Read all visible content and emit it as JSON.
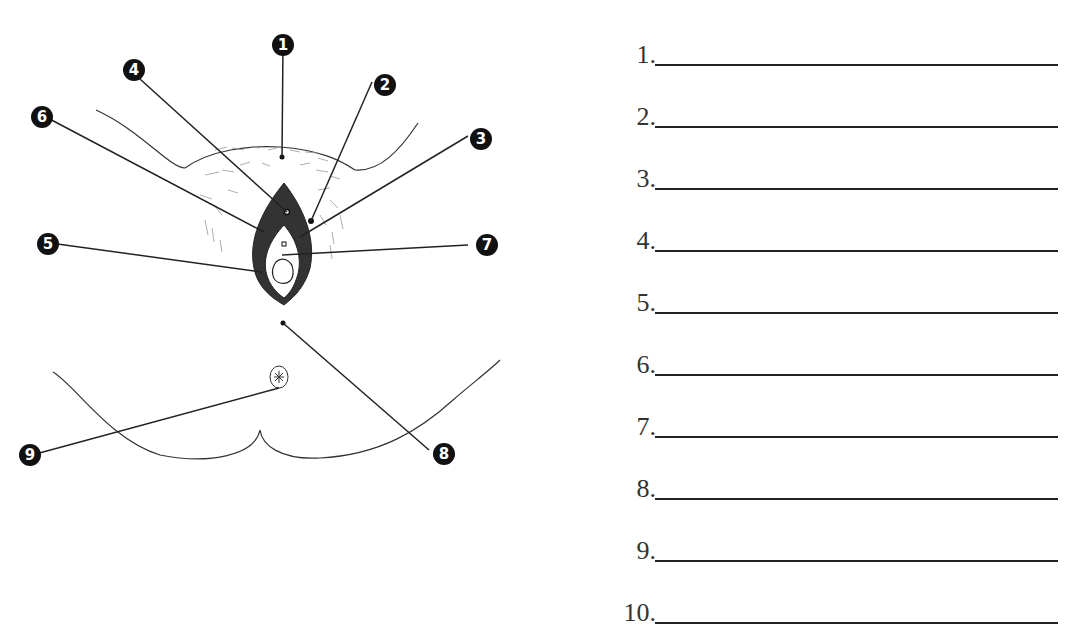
{
  "diagram": {
    "callouts": [
      {
        "label": "1",
        "x": 272,
        "y": 34
      },
      {
        "label": "2",
        "x": 374,
        "y": 74
      },
      {
        "label": "3",
        "x": 470,
        "y": 128
      },
      {
        "label": "4",
        "x": 123,
        "y": 59
      },
      {
        "label": "5",
        "x": 37,
        "y": 233
      },
      {
        "label": "6",
        "x": 31,
        "y": 106
      },
      {
        "label": "7",
        "x": 476,
        "y": 234
      },
      {
        "label": "8",
        "x": 433,
        "y": 443
      },
      {
        "label": "9",
        "x": 19,
        "y": 444
      }
    ]
  },
  "answers": {
    "items": [
      {
        "number": "1.",
        "value": ""
      },
      {
        "number": "2.",
        "value": ""
      },
      {
        "number": "3.",
        "value": ""
      },
      {
        "number": "4.",
        "value": ""
      },
      {
        "number": "5.",
        "value": ""
      },
      {
        "number": "6.",
        "value": ""
      },
      {
        "number": "7.",
        "value": ""
      },
      {
        "number": "8.",
        "value": ""
      },
      {
        "number": "9.",
        "value": ""
      },
      {
        "number": "10.",
        "value": ""
      }
    ]
  }
}
